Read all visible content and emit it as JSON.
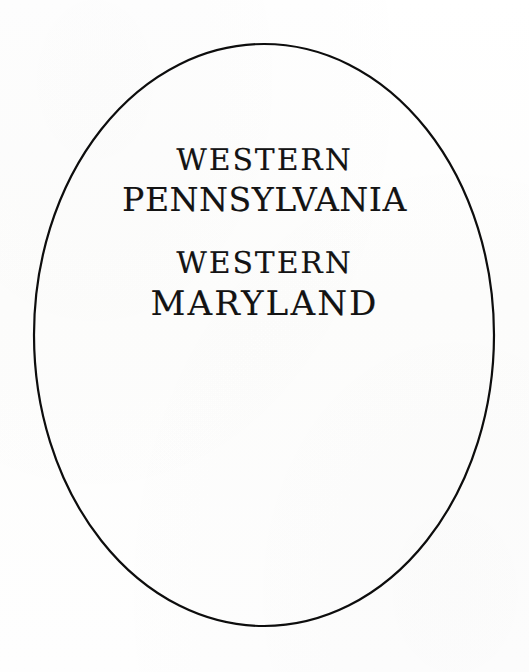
{
  "page": {
    "width": 529,
    "height": 672,
    "background_color": "#fdfdfd",
    "ink_color": "#131313",
    "kind": "scanned-book-title-page"
  },
  "frame": {
    "shape_name": "oval-border",
    "shape": "ellipse",
    "center_x": 264,
    "center_y": 335,
    "radius_x": 230,
    "radius_y": 291,
    "stroke_color": "#0d0d0d",
    "stroke_width": 2.2,
    "fill": "none"
  },
  "title_block": {
    "groups": [
      {
        "id": "pennsylvania",
        "lines": [
          {
            "text": "WESTERN",
            "size_class": "small"
          },
          {
            "text": "PENNSYLVANIA",
            "size_class": "large"
          }
        ]
      },
      {
        "id": "maryland",
        "lines": [
          {
            "text": "WESTERN",
            "size_class": "small"
          },
          {
            "text": "MARYLAND",
            "size_class": "large"
          }
        ]
      }
    ],
    "line_1": "WESTERN",
    "line_2": "PENNSYLVANIA",
    "line_3": "WESTERN",
    "line_4": "MARYLAND"
  }
}
